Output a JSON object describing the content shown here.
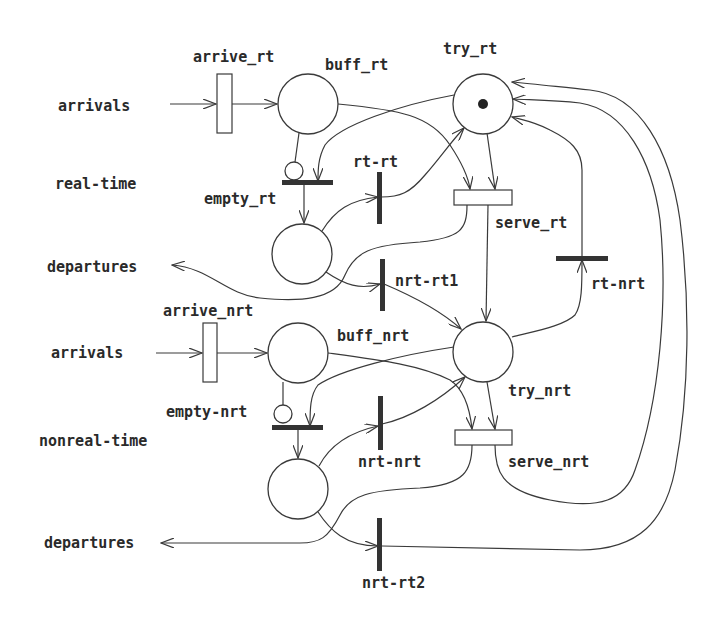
{
  "diagram": {
    "type": "petri-net",
    "side_labels": {
      "rt_arrivals": "arrivals",
      "rt_class": "real-time",
      "rt_departures": "departures",
      "nrt_arrivals": "arrivals",
      "nrt_class": "nonreal-time",
      "nrt_departures": "departures"
    },
    "places": {
      "buff_rt": "buff_rt",
      "try_rt": "try_rt",
      "empty_rt": "empty_rt",
      "buff_nrt": "buff_nrt",
      "try_nrt": "try_nrt",
      "empty_nrt": "empty-nrt"
    },
    "timed_transitions": {
      "arrive_rt": "arrive_rt",
      "serve_rt": "serve_rt",
      "arrive_nrt": "arrive_nrt",
      "serve_nrt": "serve_nrt"
    },
    "immediate_transitions": {
      "rt_rt": "rt-rt",
      "nrt_rt1": "nrt-rt1",
      "rt_nrt": "rt-nrt",
      "nrt_nrt": "nrt-nrt",
      "nrt_rt2": "nrt-rt2"
    },
    "tokens": {
      "try_rt": 1
    }
  }
}
